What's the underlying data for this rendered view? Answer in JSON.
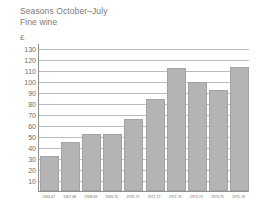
{
  "chart_data": {
    "type": "bar",
    "title": "Seasons October–July",
    "subtitle": "Fine wine",
    "ylabel": "£",
    "xlabel": "",
    "grid": true,
    "legend": "none",
    "ylim": [
      0,
      135
    ],
    "yticks": [
      10,
      20,
      30,
      40,
      50,
      60,
      70,
      80,
      90,
      100,
      110,
      120,
      130
    ],
    "ytick_labels": [
      "10",
      "20",
      "30",
      "40",
      "50",
      "60",
      "70",
      "80",
      "90",
      "100",
      "110",
      "120",
      "130"
    ],
    "categories": [
      "1966-67",
      "1967-68",
      "1968-69",
      "1969-70",
      "1970-71",
      "1971-72",
      "1972-73",
      "1973-74",
      "1974-75",
      "1975-76"
    ],
    "values": [
      32,
      45,
      52,
      52,
      66,
      84,
      112,
      99,
      92,
      113
    ],
    "bar_color": "#b4b4b4",
    "bar_border_color": "#a3a3a3",
    "grid_color": "#bcbcbc",
    "axis_color": "#8e8e8e",
    "text_color": "#6e6e6e"
  }
}
